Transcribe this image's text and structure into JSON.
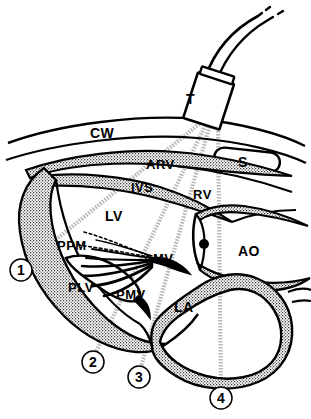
{
  "figure": {
    "kind": "echocardiography-scan-plane-diagram",
    "background_color": "#ffffff",
    "ink_color": "#000000",
    "beam_color": "#b9b9b9",
    "stipple_color": "#000000"
  },
  "transducer": {
    "label": "T",
    "name": "transducer",
    "cable_name": "transducer-cable"
  },
  "anatomy_labels": [
    {
      "id": "CW",
      "text": "CW",
      "meaning": "chest wall",
      "x": 90,
      "y": 126
    },
    {
      "id": "ARV",
      "text": "ARV",
      "meaning": "anterior right ventricular wall",
      "x": 146,
      "y": 158
    },
    {
      "id": "IVS",
      "text": "IVS",
      "meaning": "interventricular septum",
      "x": 131,
      "y": 181
    },
    {
      "id": "RV",
      "text": "RV",
      "meaning": "right ventricle",
      "x": 193,
      "y": 188
    },
    {
      "id": "LV",
      "text": "LV",
      "meaning": "left ventricle",
      "x": 105,
      "y": 209
    },
    {
      "id": "S",
      "text": "S",
      "meaning": "sternum",
      "x": 242,
      "y": 156
    },
    {
      "id": "AO",
      "text": "AO",
      "meaning": "aorta",
      "x": 240,
      "y": 245
    },
    {
      "id": "PPM",
      "text": "PPM",
      "meaning": "posterior papillary muscle",
      "x": 59,
      "y": 240
    },
    {
      "id": "AMV",
      "text": "AMV",
      "meaning": "anterior mitral valve leaflet",
      "x": 144,
      "y": 253
    },
    {
      "id": "PLV",
      "text": "PLV",
      "meaning": "posterior left ventricular wall",
      "x": 69,
      "y": 281
    },
    {
      "id": "PMV",
      "text": "PMV",
      "meaning": "posterior mitral valve leaflet",
      "x": 117,
      "y": 288
    },
    {
      "id": "LA",
      "text": "LA",
      "meaning": "left atrium",
      "x": 175,
      "y": 300
    }
  ],
  "scan_positions": [
    {
      "number": "1",
      "cx": 21,
      "cy": 270
    },
    {
      "number": "2",
      "cx": 93,
      "cy": 362
    },
    {
      "number": "3",
      "cx": 139,
      "cy": 377
    },
    {
      "number": "4",
      "cx": 221,
      "cy": 398
    }
  ]
}
